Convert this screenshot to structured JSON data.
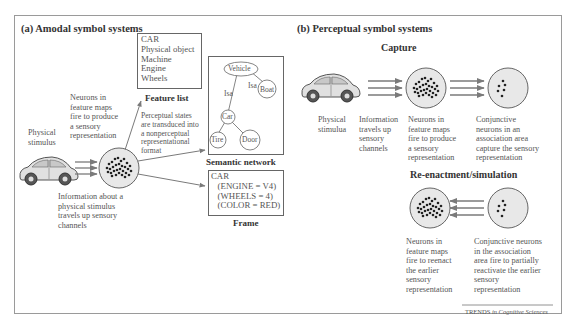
{
  "figure": {
    "credit_prefix": "TRENDS",
    "credit_suffix": " in Cognitive Sciences",
    "colors": {
      "border": "#9a9a9a",
      "arrow": "#7a7a7a",
      "circle_fill": "#e8e8e8",
      "dot": "#222222",
      "text": "#555555"
    }
  },
  "panel_a": {
    "title": "(a) Amodal symbol systems",
    "stimulus_label": "Physical\nstimulus",
    "neurons_label": "Neurons in\nfeature maps\nfire to produce\na sensory\nrepresentation",
    "info_label": "Information about a\nphysical stimulus\ntravels up sensory\nchannels",
    "transduce_label": "Perceptual states\nare transduced into\na nonperceptual\nrepresentational\nformat",
    "feature_list": {
      "lines": "CAR\nPhysical object\nMachine\nEngine\nWheels",
      "caption": "Feature list"
    },
    "semantic_network": {
      "caption": "Semantic network",
      "nodes": [
        "Vehicle",
        "Boat",
        "Car",
        "Tire",
        "Door"
      ],
      "edge_labels": [
        "Isa",
        "Isa"
      ]
    },
    "frame": {
      "lines": "CAR\n   (ENGINE = V4)\n   (WHEELS = 4)\n   (COLOR = RED)",
      "caption": "Frame"
    }
  },
  "panel_b": {
    "title": "(b) Perceptual symbol systems",
    "capture": {
      "heading": "Capture",
      "stimulus_label": "Physical\nstimulua",
      "info_label": "Information\ntravels up\nsensory\nchannels",
      "neurons_label": "Neurons in\nfeature maps\nfire to produce\na sensory\nrepresentation",
      "conjunctive_label": "Conjunctive\nneurons in an\nassociation area\ncapture the sensory\nrepresentation"
    },
    "reenactment": {
      "heading": "Re-enactment/simulation",
      "neurons_label": "Neurons in\nfeature maps\nfire to reenact\nthe earlier\nsensory\nrepresentation",
      "conjunctive_label": "Conjunctive neurons\nin the association\narea fire to partially\nreactivate the earlier\nsensory\nrepresentation"
    }
  }
}
